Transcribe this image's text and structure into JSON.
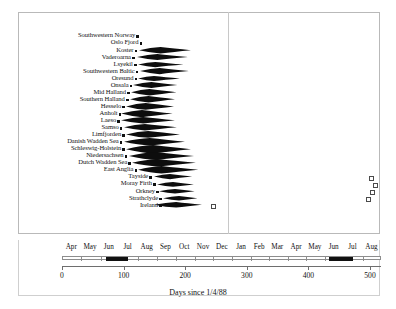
{
  "figure": {
    "xlabel": "Days since 1/4/88",
    "x_min": 0,
    "x_max": 520,
    "year_boundary_day": 275
  },
  "axis": {
    "numeric_ticks": [
      0,
      100,
      200,
      300,
      400,
      500
    ],
    "numeric_tick_labels": [
      "0",
      "100",
      "200",
      "300",
      "400",
      "500"
    ],
    "month_labels": [
      "Apr",
      "May",
      "Jun",
      "Jul",
      "Aug",
      "Sep",
      "Oct",
      "Nov",
      "Dec",
      "Jan",
      "Feb",
      "Mar",
      "Apr",
      "May",
      "Jun",
      "Jul",
      "Aug"
    ],
    "month_start_days": [
      0,
      30,
      61,
      91,
      122,
      153,
      183,
      214,
      244,
      275,
      306,
      334,
      365,
      395,
      426,
      456,
      487
    ],
    "month_end_days": [
      30,
      61,
      91,
      122,
      153,
      183,
      214,
      244,
      275,
      306,
      334,
      365,
      395,
      426,
      456,
      487,
      518
    ],
    "highlight_blocks": [
      {
        "label": "Jun-Jul peak year 1",
        "start_day": 70,
        "end_day": 105
      },
      {
        "label": "Jun-Jul peak year 2",
        "start_day": 432,
        "end_day": 470
      }
    ]
  },
  "chart_data": {
    "type": "area",
    "title": "",
    "subtitle": "",
    "xlabel": "Days since 1/4/88",
    "ylabel": "",
    "xlim": [
      0,
      520
    ],
    "grid": false,
    "legend": "none",
    "categories": [
      "Southwestern Norway",
      "Oslo Fjord",
      "Koster",
      "Vaderoarna",
      "Lsyekil",
      "Southwestern Baltic",
      "Oresund",
      "Onsala",
      "Mid Halland",
      "Southern Halland",
      "Hesselo",
      "Anholt",
      "Laeso",
      "Samso",
      "Limfjorden",
      "Danish Wadden Sea",
      "Schleswig-Holstein",
      "Niedersachsen",
      "Dutch Wadden Sea",
      "East Anglia",
      "Tayside",
      "Moray Firth",
      "Orkney",
      "Strathclyde",
      "Ireland"
    ],
    "series": [
      {
        "name": "Epidemic density kites",
        "entries": [
          {
            "label": "Southwestern Norway",
            "marker_day": 123,
            "marker": "filled",
            "kite": null
          },
          {
            "label": "Oslo Fjord",
            "marker_day": 128,
            "marker": "filled",
            "kite": null
          },
          {
            "label": "Koster",
            "marker_day": 120,
            "marker": "filled",
            "kite": {
              "start_day": 125,
              "peak_day": 160,
              "end_day": 210,
              "half_height": 3.2
            }
          },
          {
            "label": "Vaderoarna",
            "marker_day": 116,
            "marker": "filled",
            "kite": {
              "start_day": 122,
              "peak_day": 155,
              "end_day": 205,
              "half_height": 3.0
            }
          },
          {
            "label": "Lsyekil",
            "marker_day": 119,
            "marker": "filled",
            "kite": {
              "start_day": 124,
              "peak_day": 152,
              "end_day": 198,
              "half_height": 2.6
            }
          },
          {
            "label": "Southwestern Baltic",
            "marker_day": 122,
            "marker": "filled",
            "kite": {
              "start_day": 126,
              "peak_day": 158,
              "end_day": 206,
              "half_height": 3.1
            }
          },
          {
            "label": "Oresund",
            "marker_day": 120,
            "marker": "filled",
            "kite": {
              "start_day": 124,
              "peak_day": 150,
              "end_day": 192,
              "half_height": 2.5
            }
          },
          {
            "label": "Onsala",
            "marker_day": 112,
            "marker": "filled",
            "kite": {
              "start_day": 116,
              "peak_day": 146,
              "end_day": 188,
              "half_height": 3.0
            }
          },
          {
            "label": "Mid Halland",
            "marker_day": 108,
            "marker": "filled",
            "kite": {
              "start_day": 112,
              "peak_day": 142,
              "end_day": 186,
              "half_height": 3.2
            }
          },
          {
            "label": "Southern Halland",
            "marker_day": 106,
            "marker": "filled",
            "kite": {
              "start_day": 110,
              "peak_day": 140,
              "end_day": 184,
              "half_height": 3.3
            }
          },
          {
            "label": "Hesselo",
            "marker_day": 100,
            "marker": "filled",
            "kite": {
              "start_day": 104,
              "peak_day": 136,
              "end_day": 182,
              "half_height": 3.4
            }
          },
          {
            "label": "Anholt",
            "marker_day": 94,
            "marker": "filled",
            "kite": {
              "start_day": 96,
              "peak_day": 130,
              "end_day": 180,
              "half_height": 3.6
            }
          },
          {
            "label": "Laeso",
            "marker_day": 92,
            "marker": "filled",
            "kite": {
              "start_day": 96,
              "peak_day": 132,
              "end_day": 184,
              "half_height": 3.3
            }
          },
          {
            "label": "Samso",
            "marker_day": 96,
            "marker": "filled",
            "kite": {
              "start_day": 100,
              "peak_day": 134,
              "end_day": 186,
              "half_height": 3.2
            }
          },
          {
            "label": "Limfjorden",
            "marker_day": 100,
            "marker": "filled",
            "kite": {
              "start_day": 104,
              "peak_day": 140,
              "end_day": 192,
              "half_height": 3.4
            }
          },
          {
            "label": "Danish Wadden Sea",
            "marker_day": 96,
            "marker": "filled",
            "kite": {
              "start_day": 100,
              "peak_day": 142,
              "end_day": 200,
              "half_height": 3.8
            }
          },
          {
            "label": "Schleswig-Holstein",
            "marker_day": 100,
            "marker": "filled",
            "kite": {
              "start_day": 104,
              "peak_day": 148,
              "end_day": 210,
              "half_height": 4.2
            }
          },
          {
            "label": "Niedersachsen",
            "marker_day": 104,
            "marker": "filled",
            "kite": {
              "start_day": 108,
              "peak_day": 152,
              "end_day": 214,
              "half_height": 4.0
            }
          },
          {
            "label": "Dutch Wadden Sea",
            "marker_day": 110,
            "marker": "filled",
            "kite": {
              "start_day": 114,
              "peak_day": 156,
              "end_day": 218,
              "half_height": 3.8
            }
          },
          {
            "label": "East Anglia",
            "marker_day": 120,
            "marker": "filled",
            "kite": {
              "start_day": 124,
              "peak_day": 162,
              "end_day": 222,
              "half_height": 3.8
            }
          },
          {
            "label": "Tayside",
            "marker_day": 144,
            "marker": "filled",
            "kite": {
              "start_day": 150,
              "peak_day": 176,
              "end_day": 212,
              "half_height": 2.6
            },
            "extra_marker_day": 500,
            "extra_marker": "open"
          },
          {
            "label": "Moray Firth",
            "marker_day": 150,
            "marker": "filled",
            "kite": {
              "start_day": 154,
              "peak_day": 180,
              "end_day": 214,
              "half_height": 2.4
            },
            "extra_marker_day": 508,
            "extra_marker": "open"
          },
          {
            "label": "Orkney",
            "marker_day": 155,
            "marker": "filled",
            "kite": {
              "start_day": 158,
              "peak_day": 184,
              "end_day": 216,
              "half_height": 2.2
            },
            "extra_marker_day": 502,
            "extra_marker": "open"
          },
          {
            "label": "Strathclyde",
            "marker_day": 160,
            "marker": "filled",
            "kite": {
              "start_day": 164,
              "peak_day": 190,
              "end_day": 220,
              "half_height": 2.2
            },
            "extra_marker_day": 496,
            "extra_marker": "open"
          },
          {
            "label": "Ireland",
            "marker_day": 160,
            "marker": "filled",
            "kite": {
              "start_day": 150,
              "peak_day": 186,
              "end_day": 228,
              "half_height": 2.8
            },
            "extra_marker_day": 245,
            "extra_marker": "open"
          }
        ]
      }
    ]
  }
}
